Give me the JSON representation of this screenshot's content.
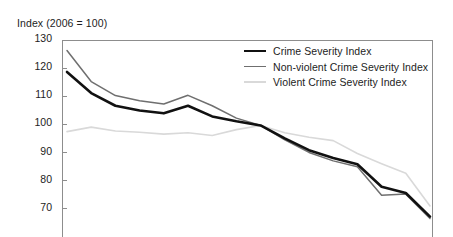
{
  "chart_data": {
    "type": "line",
    "title": "Index (2006 = 100)",
    "xlabel": "",
    "ylabel": "Index (2006 = 100)",
    "ylim": [
      60,
      130
    ],
    "yticks": [
      130,
      120,
      110,
      100,
      90,
      80,
      70
    ],
    "grid": false,
    "legend_position": "top-right",
    "note": "All three series are indexed so that 2006 = 100; the lines intersect at 100 at the base year.",
    "x": [
      0,
      1,
      2,
      3,
      4,
      5,
      6,
      7,
      8,
      9,
      10,
      11,
      12,
      13,
      14,
      15
    ],
    "series": [
      {
        "name": "Crime Severity Index",
        "color": "#111111",
        "width": 2.6,
        "values": [
          119.0,
          111.5,
          107.0,
          105.3,
          104.3,
          107.0,
          103.2,
          101.5,
          100.0,
          95.4,
          91.2,
          88.4,
          86.2,
          78.2,
          76.0,
          67.6
        ]
      },
      {
        "name": "Non-violent Crime Severity Index",
        "color": "#6f6f6f",
        "width": 1.5,
        "values": [
          126.6,
          115.6,
          110.6,
          108.8,
          107.6,
          110.7,
          107.0,
          102.6,
          100.0,
          94.9,
          90.4,
          87.4,
          85.3,
          75.2,
          75.6,
          66.9
        ]
      },
      {
        "name": "Violent Crime Severity Index",
        "color": "#d9d9d9",
        "width": 1.6,
        "values": [
          97.8,
          99.4,
          98.0,
          97.6,
          96.9,
          97.4,
          96.4,
          98.5,
          100.0,
          97.4,
          95.8,
          94.6,
          90.0,
          86.4,
          83.0,
          71.4
        ]
      }
    ]
  },
  "legend": {
    "entries": [
      {
        "label": "Crime Severity Index",
        "swatch": "line-swatch-black"
      },
      {
        "label": "Non-violent Crime Severity Index",
        "swatch": "line-swatch-gray"
      },
      {
        "label": "Violent Crime Severity Index",
        "swatch": "line-swatch-light"
      }
    ]
  },
  "axis": {
    "title": "Index (2006 = 100)",
    "y_tick_labels": [
      "130",
      "120",
      "110",
      "100",
      "90",
      "80",
      "70"
    ]
  },
  "colors": {
    "crime_severity": "#111111",
    "non_violent": "#6f6f6f",
    "violent": "#d9d9d9",
    "axis": "#8d8d8d",
    "text": "#1d1d1d",
    "background": "#ffffff"
  }
}
